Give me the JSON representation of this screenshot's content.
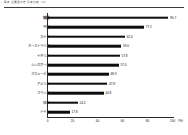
{
  "header": {
    "title": "図表 主要国の普及率比較（％）"
  },
  "chart_data": {
    "type": "bar",
    "orientation": "horizontal",
    "title": "",
    "xlabel": "",
    "ylabel": "",
    "unit": "（％）",
    "xlim": [
      0,
      100
    ],
    "xticks": [
      0,
      20,
      40,
      60,
      80,
      100
    ],
    "xtick_labels": [
      "0",
      "20",
      "40",
      "60",
      "80",
      "100"
    ],
    "grid": false,
    "legend": "none",
    "bar_color": "#0d0d0d",
    "categories": [
      "韓国",
      "中国",
      "カナダ",
      "オーストラリア",
      "イギリス",
      "シンガポール",
      "スウェーデン",
      "アメリカ",
      "フランス",
      "日本",
      "ドイツ"
    ],
    "values": [
      96.7,
      77.2,
      62.0,
      59.0,
      57.8,
      57.0,
      48.9,
      47.8,
      44.8,
      24.2,
      17.8
    ],
    "value_labels": [
      "96.7",
      "77.2",
      "62.0",
      "59.0",
      "57.8",
      "57.0",
      "48.9",
      "47.8",
      "44.8",
      "24.2",
      "17.8"
    ],
    "emphasized_categories": [
      "韓国",
      "日本"
    ]
  }
}
